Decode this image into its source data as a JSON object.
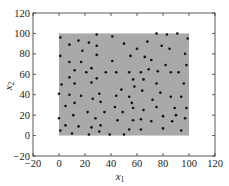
{
  "chart_data": {
    "type": "scatter",
    "title": "",
    "xlabel": "x1",
    "ylabel": "x2",
    "xlabel_main": "x",
    "xlabel_sub": "1",
    "ylabel_main": "x",
    "ylabel_sub": "2",
    "xlim": [
      -20,
      120
    ],
    "ylim": [
      -20,
      120
    ],
    "xticks": [
      -20,
      0,
      20,
      40,
      60,
      80,
      100,
      120
    ],
    "yticks": [
      -20,
      0,
      20,
      40,
      60,
      80,
      100,
      120
    ],
    "xtick_labels": [
      "−20",
      "0",
      "20",
      "40",
      "60",
      "80",
      "100",
      "120"
    ],
    "ytick_labels": [
      "−20",
      "0",
      "20",
      "40",
      "60",
      "80",
      "100",
      "120"
    ],
    "grid": false,
    "legend": null,
    "region": {
      "x": [
        0,
        100
      ],
      "y": [
        0,
        100
      ],
      "color": "#a9a9a9"
    },
    "marker_color": "#111111",
    "points": [
      [
        1,
        96
      ],
      [
        8,
        89
      ],
      [
        15,
        93
      ],
      [
        23,
        91
      ],
      [
        29,
        99
      ],
      [
        29,
        88
      ],
      [
        41,
        97
      ],
      [
        50,
        90
      ],
      [
        60,
        85
      ],
      [
        68,
        92
      ],
      [
        75,
        100
      ],
      [
        83,
        99
      ],
      [
        91,
        100
      ],
      [
        99,
        95
      ],
      [
        79,
        88
      ],
      [
        85,
        85
      ],
      [
        1,
        78
      ],
      [
        18,
        83
      ],
      [
        8,
        72
      ],
      [
        17,
        72
      ],
      [
        12,
        64
      ],
      [
        25,
        66
      ],
      [
        29,
        79
      ],
      [
        41,
        73
      ],
      [
        55,
        78
      ],
      [
        66,
        77
      ],
      [
        71,
        74
      ],
      [
        82,
        69
      ],
      [
        97,
        80
      ],
      [
        98,
        69
      ],
      [
        21,
        62
      ],
      [
        36,
        62
      ],
      [
        44,
        62
      ],
      [
        54,
        62
      ],
      [
        63,
        62
      ],
      [
        69,
        65
      ],
      [
        76,
        63
      ],
      [
        86,
        62
      ],
      [
        92,
        62
      ],
      [
        8,
        57
      ],
      [
        29,
        56
      ],
      [
        57,
        55
      ],
      [
        65,
        55
      ],
      [
        75,
        51
      ],
      [
        96,
        51
      ],
      [
        2,
        50
      ],
      [
        12,
        51
      ],
      [
        25,
        52
      ],
      [
        0,
        41
      ],
      [
        8,
        40
      ],
      [
        17,
        39
      ],
      [
        31,
        41
      ],
      [
        44,
        39
      ],
      [
        48,
        45
      ],
      [
        54,
        38
      ],
      [
        58,
        48
      ],
      [
        64,
        44
      ],
      [
        72,
        35
      ],
      [
        78,
        42
      ],
      [
        86,
        38
      ],
      [
        94,
        38
      ],
      [
        5,
        29
      ],
      [
        12,
        32
      ],
      [
        26,
        36
      ],
      [
        32,
        33
      ],
      [
        35,
        23
      ],
      [
        22,
        23
      ],
      [
        43,
        28
      ],
      [
        56,
        32
      ],
      [
        57,
        27
      ],
      [
        65,
        25
      ],
      [
        75,
        28
      ],
      [
        89,
        27
      ],
      [
        98,
        27
      ],
      [
        0,
        17
      ],
      [
        11,
        20
      ],
      [
        28,
        17
      ],
      [
        49,
        23
      ],
      [
        57,
        15
      ],
      [
        63,
        16
      ],
      [
        71,
        14
      ],
      [
        80,
        19
      ],
      [
        90,
        20
      ],
      [
        87,
        14
      ],
      [
        97,
        17
      ],
      [
        1,
        5
      ],
      [
        5,
        10
      ],
      [
        15,
        9
      ],
      [
        25,
        8
      ],
      [
        32,
        10
      ],
      [
        31,
        4
      ],
      [
        10,
        2
      ],
      [
        23,
        1
      ],
      [
        39,
        1
      ],
      [
        50,
        1
      ],
      [
        45,
        15
      ],
      [
        54,
        6
      ],
      [
        63,
        6
      ],
      [
        80,
        7
      ],
      [
        94,
        5
      ]
    ]
  }
}
